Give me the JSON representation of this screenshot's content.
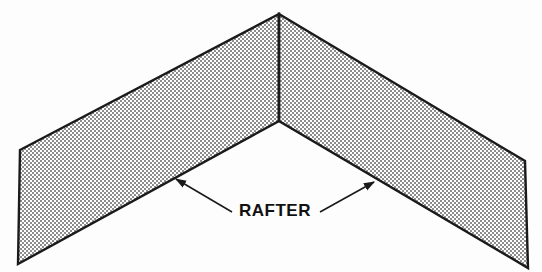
{
  "diagram": {
    "title": "Rafter",
    "background_color": "#fdfdfd",
    "outline_color": "#1a1a1a",
    "fill_color": "#a8a8a8",
    "fill_style": "halftone-dot-screen",
    "label": {
      "text": "RAFTER",
      "x": 275,
      "y": 216,
      "color": "#111111"
    },
    "parts": [
      {
        "name": "left-rafter",
        "polygon": "20,150 279,14 279,121 18,264"
      },
      {
        "name": "right-rafter",
        "polygon": "279,14 525,161 528,268 279,121"
      }
    ],
    "joint": {
      "name": "ridge-butt-joint",
      "x1": 279,
      "y1": 14,
      "x2": 279,
      "y2": 121
    },
    "leaders": [
      {
        "name": "left-leader",
        "x1": 232,
        "y1": 212,
        "x2": 174,
        "y2": 178,
        "arrow_at": "end"
      },
      {
        "name": "right-leader",
        "x1": 320,
        "y1": 212,
        "x2": 376,
        "y2": 181,
        "arrow_at": "end"
      }
    ]
  }
}
